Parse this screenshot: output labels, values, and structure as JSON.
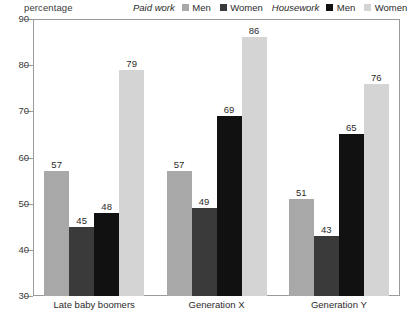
{
  "axis_title": "percentage",
  "legend": {
    "groups": [
      {
        "title": "Paid work",
        "items": [
          {
            "label": "Men",
            "color": "#a8a8a8"
          },
          {
            "label": "Women",
            "color": "#3a3a3a"
          }
        ]
      },
      {
        "title": "Housework",
        "items": [
          {
            "label": "Men",
            "color": "#111111"
          },
          {
            "label": "Women",
            "color": "#d4d4d4"
          }
        ]
      }
    ]
  },
  "chart_data": {
    "type": "bar",
    "title": "",
    "subtitle": "",
    "xlabel": "",
    "ylabel": "percentage",
    "ylim": [
      30,
      90
    ],
    "yticks": [
      30,
      40,
      50,
      60,
      70,
      80,
      90
    ],
    "ytick_labels": [
      "30",
      "40",
      "50",
      "60",
      "70",
      "80",
      "90"
    ],
    "grid": false,
    "legend_position": "top-right",
    "categories": [
      "Late baby boomers",
      "Generation X",
      "Generation Y"
    ],
    "series": [
      {
        "name": "Paid work Men",
        "color": "#a8a8a8",
        "values": [
          57,
          57,
          51
        ]
      },
      {
        "name": "Paid work Women",
        "color": "#3a3a3a",
        "values": [
          45,
          49,
          43
        ]
      },
      {
        "name": "Housework Men",
        "color": "#111111",
        "values": [
          48,
          69,
          65
        ]
      },
      {
        "name": "Housework Women",
        "color": "#d4d4d4",
        "values": [
          79,
          86,
          76
        ]
      }
    ],
    "data_labels": [
      [
        "57",
        "45",
        "48",
        "79"
      ],
      [
        "57",
        "49",
        "69",
        "86"
      ],
      [
        "51",
        "43",
        "65",
        "76"
      ]
    ]
  }
}
